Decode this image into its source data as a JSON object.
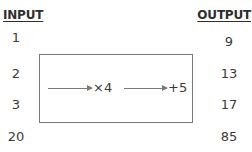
{
  "headers": {
    "input": "INPUT",
    "output": "OUTPUT"
  },
  "rows": [
    {
      "input": "1",
      "output": "9"
    },
    {
      "input": "2",
      "output": "13"
    },
    {
      "input": "3",
      "output": "17"
    },
    {
      "input": "20",
      "output": "85"
    }
  ],
  "machine": {
    "steps": [
      {
        "operation": "×4"
      },
      {
        "operation": "+5"
      }
    ]
  },
  "colors": {
    "line": "#7a7a7a",
    "text": "#3a3a3a"
  }
}
